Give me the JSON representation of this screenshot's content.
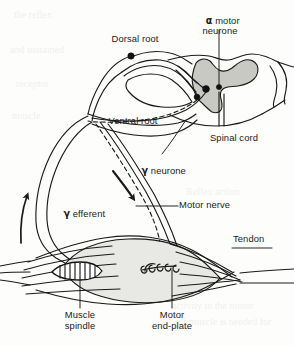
{
  "figure": {
    "background_color": "#fdfdfc",
    "ink_color": "#1a1a1a",
    "grey_matter_color": "#c9c9c4",
    "muscle_fill_color": "#e8e8e4"
  },
  "labels": {
    "alpha_motor_neurone": "α motor\nneurone",
    "alpha_symbol": "α",
    "alpha_text": " motor\nneurone",
    "dorsal_root": "Dorsal root",
    "ventral_root": "Ventral root",
    "spinal_cord": "Spinal cord",
    "gamma_neurone_symbol": "γ",
    "gamma_neurone_text": " neurone",
    "gamma_efferent_symbol": "γ",
    "gamma_efferent_text": " efferent",
    "motor_nerve": "Motor nerve",
    "tendon": "Tendon",
    "muscle_spindle": "Muscle\nspindle",
    "motor_end_plate": "Motor\nend-plate"
  },
  "bleed_through": {
    "line1": "the reflex",
    "line2": "and sustained",
    "line3": "receptor",
    "line4": "muscle",
    "line5": "Reflex action",
    "line6": "activity in the motor",
    "line7": "of muscle is needed for"
  }
}
